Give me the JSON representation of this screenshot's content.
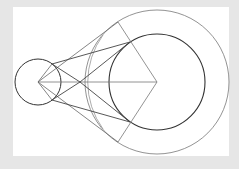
{
  "diagram": {
    "type": "geometric-construction",
    "colors": {
      "background": "#e6e6e6",
      "panel": "#ffffff",
      "stroke_dark": "#333333",
      "stroke_light": "#777777"
    },
    "small_circle": {
      "cx": 38,
      "cy": 82,
      "r": 23
    },
    "inner_circle": {
      "cx": 157,
      "cy": 82,
      "r": 48
    },
    "outer_circle": {
      "cx": 157,
      "cy": 82,
      "r": 72
    },
    "arc_circle": {
      "cx": 38,
      "cy": 82,
      "r": 80
    },
    "vertex_left": {
      "x": 38,
      "y": 82
    },
    "vertex_right": {
      "x": 157,
      "y": 82
    }
  }
}
